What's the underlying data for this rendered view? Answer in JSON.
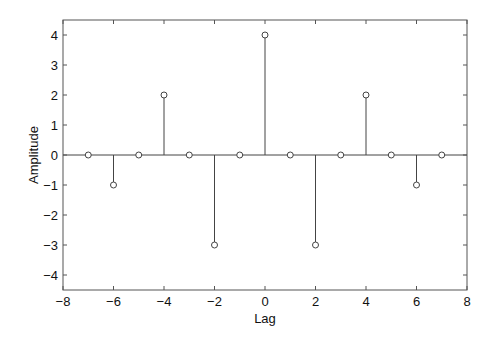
{
  "chart_data": {
    "type": "stem",
    "title": "",
    "xlabel": "Lag",
    "ylabel": "Amplitude",
    "xlim": [
      -8,
      8
    ],
    "ylim": [
      -4.5,
      4.5
    ],
    "xticks": [
      -8,
      -6,
      -4,
      -2,
      0,
      2,
      4,
      6,
      8
    ],
    "yticks": [
      -4,
      -3,
      -2,
      -1,
      0,
      1,
      2,
      3,
      4
    ],
    "x": [
      -7,
      -6,
      -5,
      -4,
      -3,
      -2,
      -1,
      0,
      1,
      2,
      3,
      4,
      5,
      6,
      7
    ],
    "values": [
      0,
      -1,
      0,
      2,
      0,
      -3,
      0,
      4,
      0,
      -3,
      0,
      2,
      0,
      -1,
      0
    ],
    "marker": "circle-open",
    "baseline": 0,
    "grid": false,
    "legend": null
  },
  "colors": {
    "axis": "#555555",
    "stem": "#444444",
    "text": "#111111"
  }
}
